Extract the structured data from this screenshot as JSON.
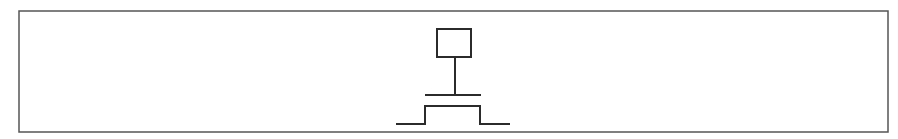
{
  "diagram": {
    "type": "schematic-symbol",
    "colors": {
      "background": "#ffffff",
      "stroke": "#2b2b2b",
      "frame": "#555555"
    },
    "frame": {
      "x1": 19,
      "y1": 10,
      "x2": 888,
      "y2": 132
    },
    "elements": {
      "terminal_box": {
        "x": 437,
        "y": 29,
        "width": 34,
        "height": 28
      },
      "stem": {
        "x": 455,
        "y1": 57,
        "y2": 95
      },
      "gate_bar": {
        "x1": 425,
        "y1": 95,
        "x2": 481
      },
      "channel_path": [
        [
          396,
          124
        ],
        [
          425,
          124
        ],
        [
          425,
          106
        ],
        [
          480,
          106
        ],
        [
          480,
          124
        ],
        [
          510,
          124
        ]
      ]
    }
  }
}
